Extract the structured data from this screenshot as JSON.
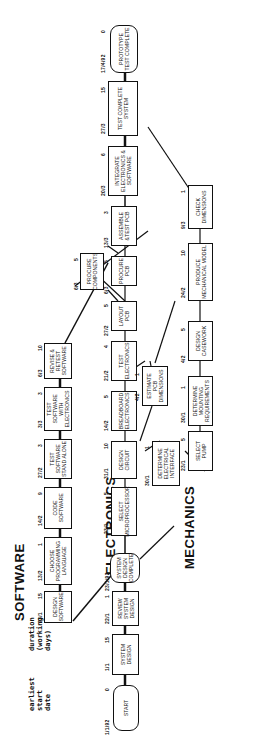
{
  "headers": {
    "software": "SOFTWARE",
    "electronics": "ELECTRONICS",
    "mechanics": "MECHANICS"
  },
  "legend": {
    "start_date": "earliest start date",
    "duration": "duration (working days)"
  },
  "nodes": {
    "start": {
      "label": "START",
      "date": "1/1/92",
      "dur": "0"
    },
    "system_design": {
      "label": "SYSTEM DESIGN",
      "date": "1/1",
      "dur": "15"
    },
    "review_system_design": {
      "label": "REVIEW SYSTEM DESIGN",
      "date": "22/1",
      "dur": "1"
    },
    "system_design_complete": {
      "label": "SYSTEM DESIGN COMPLETE",
      "date": "23/1/92",
      "dur": ""
    },
    "design_software": {
      "label": "DESIGN SOFTWARE",
      "date": "23/1",
      "dur": "15"
    },
    "choose_language": {
      "label": "CHOOSE PROGRAMMING LANGUAGE",
      "date": "13/2",
      "dur": "1"
    },
    "code_software": {
      "label": "CODE SOFTWARE",
      "date": "14/2",
      "dur": "9"
    },
    "test_software_standalone": {
      "label": "TEST SOFTWARE STAND ALONE",
      "date": "27/2",
      "dur": "3"
    },
    "test_software_electronics": {
      "label": "TEST SOFTWARE WITH ELECTRONICS",
      "date": "3/3",
      "dur": "3"
    },
    "revise_retest": {
      "label": "REVISE & RETEST SOFTWARE",
      "date": "6/3",
      "dur": "10"
    },
    "select_microprocessor": {
      "label": "SELECT MICROPROCESSOR",
      "date": "23/1",
      "dur": "5"
    },
    "design_circuit": {
      "label": "DESIGN CIRCUIT",
      "date": "31/1",
      "dur": "10"
    },
    "breadboard": {
      "label": "BREADBOARD ELECTRONICS",
      "date": "14/2",
      "dur": "5"
    },
    "test_electronics": {
      "label": "TEST ELECTRONICS",
      "date": "21/2",
      "dur": "4"
    },
    "layout_pcb": {
      "label": "LAYOUT PCB",
      "date": "27/2",
      "dur": "5"
    },
    "procure_components": {
      "label": "PROCURE COMPONENTS",
      "date": "6/3",
      "dur": "5"
    },
    "procure_pcb": {
      "label": "PROCURE PCB",
      "date": "6/3",
      "dur": "5"
    },
    "assemble_pcb": {
      "label": "ASSEMBLE &TEST PCB",
      "date": "13/3",
      "dur": "3"
    },
    "integrate": {
      "label": "INTEGRATE ELECTRONICS & SOFTWARE",
      "date": "20/3",
      "dur": "6"
    },
    "test_complete_system": {
      "label": "TEST COMPLETE SYSTEM",
      "date": "27/3",
      "dur": "15"
    },
    "prototype_complete": {
      "label": "PROTOTYPE TEST COMPLETE",
      "date": "17/4/92",
      "dur": "0"
    },
    "estimate_pcb": {
      "label": "ESTIMATE PCB DIMENSIONS",
      "date": "4/2",
      "dur": "1"
    },
    "determine_interface": {
      "label": "DETERMINE ELECTRICAL INTERFACE",
      "date": "30/1",
      "dur": "1"
    },
    "select_pump": {
      "label": "SELECT PUMP",
      "date": "23/1",
      "dur": "5"
    },
    "determine_mounting": {
      "label": "DETERMINE MOUNTING REQUIREMENTS",
      "date": "30/1",
      "dur": "1"
    },
    "design_casework": {
      "label": "DESIGN CASEWORK",
      "date": "4/2",
      "dur": "5"
    },
    "produce_model": {
      "label": "PRODUCE MECHANICAL MODEL",
      "date": "24/2",
      "dur": "10"
    },
    "check_dimensions": {
      "label": "CHECK DIMENSIONS",
      "date": "9/3",
      "dur": "1"
    }
  }
}
